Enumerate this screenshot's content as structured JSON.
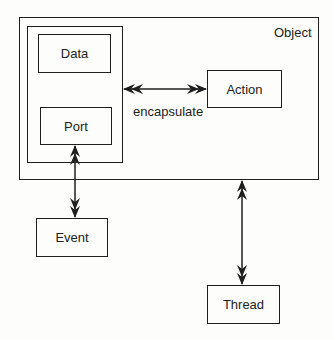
{
  "diagram": {
    "object_label": "Object",
    "data_label": "Data",
    "port_label": "Port",
    "action_label": "Action",
    "event_label": "Event",
    "thread_label": "Thread",
    "encapsulate_label": "encapsulate"
  },
  "colors": {
    "stroke": "#1f1f1f",
    "background": "#fdfdfb"
  }
}
